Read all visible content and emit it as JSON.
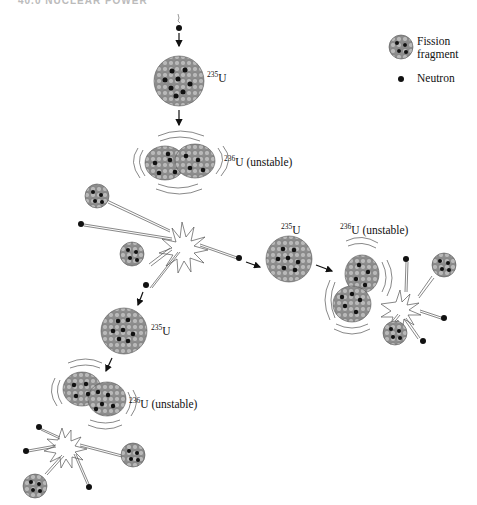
{
  "page_header": "40.0 NUCLEAR POWER",
  "legend": {
    "fission_fragment": "Fission fragment",
    "fission_fragment_line1": "Fission",
    "fission_fragment_line2": "fragment",
    "neutron": "Neutron"
  },
  "labels": {
    "u235_mass": "235",
    "u236_mass": "236",
    "element": "U",
    "unstable": "(unstable)"
  },
  "diagram": {
    "stages": [
      {
        "name": "incoming-neutron"
      },
      {
        "name": "u235-nucleus-1",
        "label": "235U"
      },
      {
        "name": "u236-unstable-1",
        "label": "236U (unstable)"
      },
      {
        "name": "fission-1",
        "products": [
          "2 fission fragments",
          "3 neutrons"
        ]
      },
      {
        "name": "u235-nucleus-2",
        "label": "235U"
      },
      {
        "name": "u236-unstable-2",
        "label": "236U (unstable)"
      },
      {
        "name": "fission-2",
        "products": [
          "2 fission fragments",
          "3 neutrons"
        ]
      },
      {
        "name": "u235-nucleus-3",
        "label": "235U"
      },
      {
        "name": "u236-unstable-3",
        "label": "236U (unstable)"
      },
      {
        "name": "fission-3",
        "products": [
          "2 fission fragments",
          "3 neutrons"
        ]
      }
    ]
  },
  "colors": {
    "nucleon": "#a8a8a8",
    "nucleon_edge": "#6a6a6a",
    "neutron": "#111111",
    "background": "#ffffff"
  }
}
